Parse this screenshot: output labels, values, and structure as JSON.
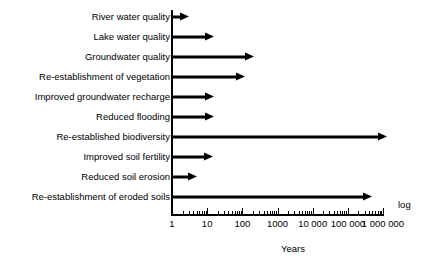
{
  "chart_data": {
    "type": "bar",
    "title": "",
    "subtitle": "",
    "xlabel": "Years",
    "ylabel": "",
    "scale_note": "log",
    "axis": {
      "type": "log",
      "base": 10,
      "xlim": [
        1,
        1000000
      ],
      "decade_tick_labels": [
        "1",
        "10",
        "100",
        "1000",
        "10 000",
        "100 000",
        "1 000 000"
      ],
      "decade_tick_values": [
        1,
        10,
        100,
        1000,
        10000,
        100000,
        1000000
      ],
      "minor_ticks_per_decade": [
        2,
        3,
        4,
        5,
        6,
        7,
        8,
        9
      ],
      "grid": false,
      "legend": "none"
    },
    "orientation": "horizontal",
    "marker": "arrow",
    "categories": [
      "River water quality",
      "Lake water quality",
      "Groundwater quality",
      "Re-establishment of vegetation",
      "Improved groundwater recharge",
      "Reduced flooding",
      "Re-established biodiversity",
      "Improved soil fertility",
      "Reduced soil erosion",
      "Re-establishment of eroded soils"
    ],
    "values": [
      3,
      16,
      220,
      120,
      16,
      16,
      1300000,
      15,
      5,
      500000
    ],
    "bars": [
      {
        "label": "River water quality",
        "value": 3
      },
      {
        "label": "Lake water quality",
        "value": 16
      },
      {
        "label": "Groundwater quality",
        "value": 220
      },
      {
        "label": "Re-establishment of vegetation",
        "value": 120
      },
      {
        "label": "Improved groundwater recharge",
        "value": 16
      },
      {
        "label": "Reduced flooding",
        "value": 16
      },
      {
        "label": "Re-established biodiversity",
        "value": 1300000
      },
      {
        "label": "Improved soil fertility",
        "value": 15
      },
      {
        "label": "Reduced soil erosion",
        "value": 5
      },
      {
        "label": "Re-establishment of eroded soils",
        "value": 500000
      }
    ],
    "colors": {
      "arrow": "#000000",
      "axis": "#000000",
      "background": "#ffffff",
      "text": "#000000"
    }
  }
}
